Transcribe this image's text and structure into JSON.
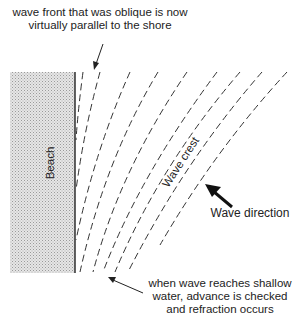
{
  "annotations": {
    "top": "wave front that was oblique is now virtually parallel to the shore",
    "top_line1": "wave front that was oblique is now",
    "top_line2": "virtually parallel to the shore",
    "bottom_line1": "when wave reaches shallow",
    "bottom_line2": "water, advance is checked",
    "bottom_line3": "and refraction occurs",
    "wave_direction": "Wave direction",
    "wave_crest": "Wave crest",
    "beach": "Beach"
  },
  "colors": {
    "beach_fill": "#d6d6d6",
    "line": "#333333",
    "background": "#ffffff"
  }
}
